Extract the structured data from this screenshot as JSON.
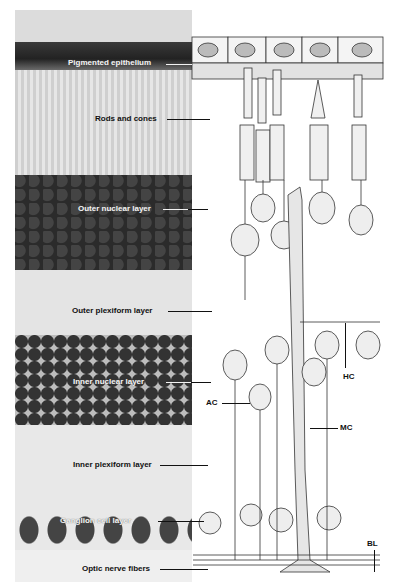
{
  "figure": {
    "layer_labels": [
      {
        "id": "pigmented-epithelium",
        "text": "Pigmented epithelium",
        "style": "light"
      },
      {
        "id": "rods-and-cones",
        "text": "Rods and cones",
        "style": "dark"
      },
      {
        "id": "outer-nuclear-layer",
        "text": "Outer nuclear layer",
        "style": "light"
      },
      {
        "id": "outer-plexiform-layer",
        "text": "Outer plexiform layer",
        "style": "dark"
      },
      {
        "id": "inner-nuclear-layer",
        "text": "Inner nuclear layer",
        "style": "light"
      },
      {
        "id": "inner-plexiform-layer",
        "text": "Inner plexiform layer",
        "style": "dark"
      },
      {
        "id": "ganglion-cell-layer",
        "text": "Ganglion cell layer",
        "style": "light"
      },
      {
        "id": "optic-nerve-fibers",
        "text": "Optic nerve fibers",
        "style": "dark"
      }
    ],
    "cell_labels": [
      {
        "id": "amacrine-cell",
        "text": "AC"
      },
      {
        "id": "horizontal-cell",
        "text": "HC"
      },
      {
        "id": "muller-cell",
        "text": "MC"
      },
      {
        "id": "basal-lamina",
        "text": "BL"
      }
    ]
  }
}
